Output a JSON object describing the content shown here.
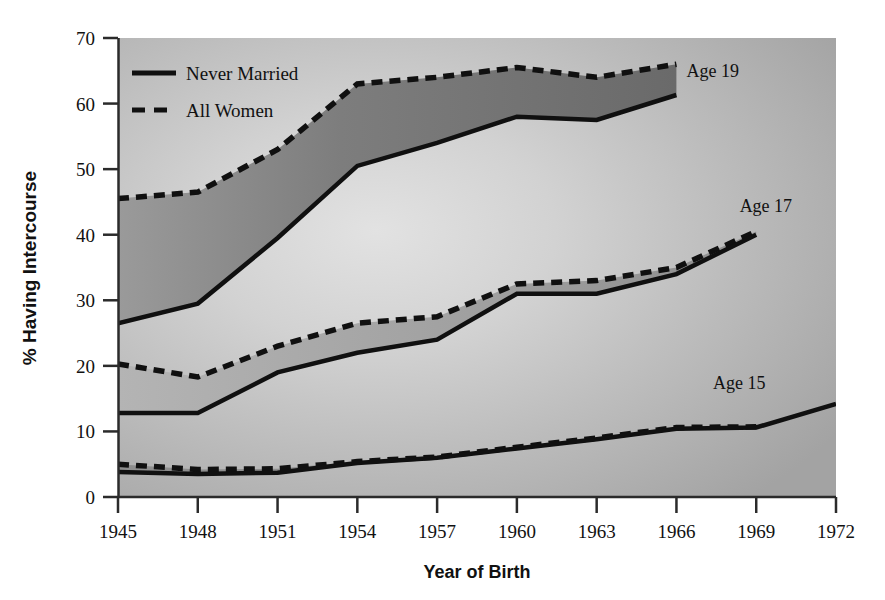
{
  "chart_data": {
    "type": "line",
    "title": "",
    "xlabel": "Year of Birth",
    "ylabel": "% Having Intercourse",
    "xlim": [
      1945,
      1972
    ],
    "ylim": [
      0,
      70
    ],
    "xticks": [
      "1945",
      "1948",
      "1951",
      "1954",
      "1957",
      "1960",
      "1963",
      "1966",
      "1969",
      "1972"
    ],
    "yticks": [
      "0",
      "10",
      "20",
      "30",
      "40",
      "50",
      "60",
      "70"
    ],
    "grid": false,
    "legend_position": "upper-left",
    "legend": [
      {
        "label": "Never Married",
        "style": "solid"
      },
      {
        "label": "All Women",
        "style": "dashed"
      }
    ],
    "annotations": [
      {
        "text": "Age 19",
        "x": 1966,
        "y": 64
      },
      {
        "text": "Age 17",
        "x": 1968,
        "y": 43.5
      },
      {
        "text": "Age 15",
        "x": 1967,
        "y": 16.5
      }
    ],
    "groups": [
      {
        "name": "Age 19",
        "x": [
          1945,
          1948,
          1951,
          1954,
          1957,
          1960,
          1963,
          1966
        ],
        "series": [
          {
            "name": "All Women",
            "style": "dashed",
            "values": [
              45.5,
              46.5,
              53.0,
              63.0,
              64.0,
              65.5,
              64.0,
              66.0
            ]
          },
          {
            "name": "Never Married",
            "style": "solid",
            "values": [
              26.5,
              29.5,
              39.5,
              50.5,
              54.0,
              58.0,
              57.5,
              61.3
            ]
          }
        ]
      },
      {
        "name": "Age 17",
        "x": [
          1945,
          1948,
          1951,
          1954,
          1957,
          1960,
          1963,
          1966,
          1969
        ],
        "series": [
          {
            "name": "All Women",
            "style": "dashed",
            "values": [
              20.3,
              18.3,
              23.0,
              26.5,
              27.5,
              32.5,
              33.0,
              35.0,
              40.5
            ]
          },
          {
            "name": "Never Married",
            "style": "solid",
            "values": [
              12.8,
              12.8,
              19.0,
              22.0,
              24.0,
              31.0,
              31.0,
              34.0,
              40.0
            ]
          }
        ]
      },
      {
        "name": "Age 15",
        "x": [
          1945,
          1948,
          1951,
          1954,
          1957,
          1960,
          1963,
          1966,
          1969,
          1972
        ],
        "series": [
          {
            "name": "All Women",
            "style": "dashed",
            "values": [
              5.0,
              4.2,
              4.3,
              5.4,
              6.1,
              7.6,
              9.0,
              10.6,
              10.7,
              null
            ]
          },
          {
            "name": "Never Married",
            "style": "solid",
            "values": [
              3.8,
              3.5,
              3.7,
              5.2,
              6.0,
              7.4,
              8.8,
              10.4,
              10.6,
              14.2
            ]
          }
        ]
      }
    ],
    "colors": {
      "line": "#101010",
      "band_fill": "#6f6f6f",
      "plot_bg_light": "#d7d7d7",
      "plot_bg_dark": "#a6a6a6",
      "axis": "#333333",
      "text": "#111111"
    }
  }
}
